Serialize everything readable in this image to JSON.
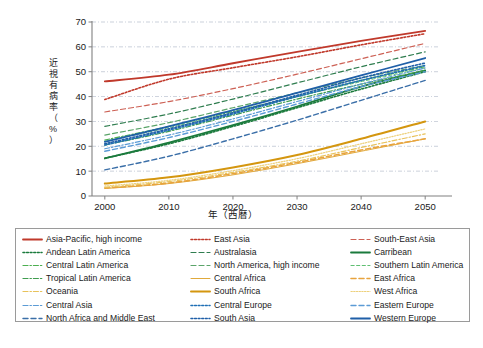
{
  "figure": {
    "background": "#ffffff",
    "axis_color": "#808080",
    "grid_color": "#9aa6bb",
    "text_color": "#1a1a1a"
  },
  "axes": {
    "y_title_chars": [
      "近",
      "視",
      "有",
      "病",
      "率",
      "（",
      "%",
      "）"
    ],
    "y_title": "近視有病率（%）",
    "x_title": "年（西暦）",
    "y_ticks": [
      "0",
      "10",
      "20",
      "30",
      "40",
      "50",
      "60",
      "70"
    ],
    "x_ticks": [
      "2000",
      "2010",
      "2020",
      "2030",
      "2040",
      "2050"
    ]
  },
  "legend": {
    "border_color": "#9a9a9a",
    "items": [
      {
        "label": "Asia-Pacific, high income",
        "color": "#c0392b",
        "style": "solid",
        "width": 1.8
      },
      {
        "label": "East Asia",
        "color": "#c0392b",
        "style": "dotted",
        "width": 1.6
      },
      {
        "label": "South-East Asia",
        "color": "#cd6155",
        "style": "dashed",
        "width": 1.2
      },
      {
        "label": "Andean Latin America",
        "color": "#1a7a3c",
        "style": "dotted",
        "width": 1.6
      },
      {
        "label": "Australasia",
        "color": "#2f7d4f",
        "style": "dashed",
        "width": 1.2
      },
      {
        "label": "Carribean",
        "color": "#1a7a3c",
        "style": "solid",
        "width": 1.8
      },
      {
        "label": "Central Latin America",
        "color": "#4caf50",
        "style": "dashdot",
        "width": 1.2
      },
      {
        "label": "North America, high income",
        "color": "#5aa469",
        "style": "dashed",
        "width": 1.2
      },
      {
        "label": "Southern Latin America",
        "color": "#5fbf72",
        "style": "dashed-fine",
        "width": 1.0
      },
      {
        "label": "Tropical Latin America",
        "color": "#3e9c4e",
        "style": "dashdot",
        "width": 1.2
      },
      {
        "label": "Central Africa",
        "color": "#e0a93b",
        "style": "solid",
        "width": 1.0
      },
      {
        "label": "East Africa",
        "color": "#e8a33d",
        "style": "dashed",
        "width": 1.6
      },
      {
        "label": "Oceania",
        "color": "#e8c25a",
        "style": "dashdot",
        "width": 1.2
      },
      {
        "label": "South Africa",
        "color": "#d4960f",
        "style": "solid",
        "width": 2.0
      },
      {
        "label": "West Africa",
        "color": "#edd07a",
        "style": "dotted",
        "width": 1.2
      },
      {
        "label": "Central Asia",
        "color": "#5b9bd5",
        "style": "dashdot",
        "width": 1.2
      },
      {
        "label": "Central Europe",
        "color": "#1f6fb5",
        "style": "dotted",
        "width": 1.6
      },
      {
        "label": "Eastern Europe",
        "color": "#5b9bd5",
        "style": "dashed",
        "width": 1.4
      },
      {
        "label": "North Africa and Middle East",
        "color": "#3b6fa8",
        "style": "dashed",
        "width": 1.4
      },
      {
        "label": "South Asia",
        "color": "#1f5fa8",
        "style": "dotted",
        "width": 1.6
      },
      {
        "label": "Western Europe",
        "color": "#1f5fa8",
        "style": "solid",
        "width": 1.8
      }
    ]
  },
  "chart_data": {
    "type": "line",
    "title": "",
    "xlabel": "年（西暦）",
    "ylabel": "近視有病率（%）",
    "xlim": [
      1998,
      2052
    ],
    "ylim": [
      0,
      70
    ],
    "grid": true,
    "legend_position": "below",
    "x": [
      2000,
      2010,
      2020,
      2030,
      2040,
      2050
    ],
    "series": [
      {
        "name": "Asia-Pacific, high income",
        "color": "#c0392b",
        "style": "solid",
        "values": [
          46.1,
          48.8,
          53.4,
          58.0,
          62.4,
          66.4
        ]
      },
      {
        "name": "East Asia",
        "color": "#c0392b",
        "style": "dotted",
        "values": [
          38.8,
          47.0,
          51.6,
          56.0,
          60.8,
          65.3
        ]
      },
      {
        "name": "South-East Asia",
        "color": "#cd6155",
        "style": "dashed",
        "values": [
          33.8,
          38.0,
          43.2,
          49.0,
          55.2,
          61.4
        ]
      },
      {
        "name": "Andean Latin America",
        "color": "#1a7a3c",
        "style": "dotted",
        "values": [
          15.2,
          21.0,
          28.0,
          35.5,
          43.0,
          50.0
        ]
      },
      {
        "name": "Australasia",
        "color": "#2f7d4f",
        "style": "dashed",
        "values": [
          28.0,
          33.0,
          39.0,
          45.5,
          52.0,
          58.0
        ]
      },
      {
        "name": "Carribean",
        "color": "#1a7a3c",
        "style": "solid",
        "values": [
          15.1,
          21.5,
          28.5,
          36.0,
          44.0,
          50.5
        ]
      },
      {
        "name": "Central Latin America",
        "color": "#4caf50",
        "style": "dashdot",
        "values": [
          22.5,
          28.0,
          34.0,
          40.0,
          46.5,
          52.0
        ]
      },
      {
        "name": "North America, high income",
        "color": "#5aa469",
        "style": "dashed",
        "values": [
          24.5,
          29.5,
          35.5,
          41.5,
          47.5,
          52.5
        ]
      },
      {
        "name": "Southern Latin America",
        "color": "#5fbf72",
        "style": "dashed-fine",
        "values": [
          22.0,
          27.5,
          33.5,
          40.0,
          46.0,
          51.5
        ]
      },
      {
        "name": "Tropical Latin America",
        "color": "#3e9c4e",
        "style": "dashdot",
        "values": [
          20.5,
          26.0,
          32.5,
          39.0,
          45.0,
          50.5
        ]
      },
      {
        "name": "Central Africa",
        "color": "#e0a93b",
        "style": "solid",
        "values": [
          3.0,
          5.0,
          8.5,
          13.0,
          18.0,
          23.0
        ]
      },
      {
        "name": "East Africa",
        "color": "#e8a33d",
        "style": "dashed",
        "values": [
          3.2,
          5.2,
          9.0,
          13.5,
          18.5,
          23.0
        ]
      },
      {
        "name": "Oceania",
        "color": "#e8c25a",
        "style": "dashdot",
        "values": [
          3.5,
          5.8,
          9.5,
          14.0,
          19.5,
          25.0
        ]
      },
      {
        "name": "South Africa",
        "color": "#d4960f",
        "style": "solid",
        "values": [
          5.0,
          7.5,
          11.5,
          16.5,
          23.0,
          30.0
        ]
      },
      {
        "name": "West Africa",
        "color": "#edd07a",
        "style": "dotted",
        "values": [
          4.0,
          6.3,
          10.2,
          15.0,
          21.0,
          27.0
        ]
      },
      {
        "name": "Central Asia",
        "color": "#5b9bd5",
        "style": "dashdot",
        "values": [
          19.0,
          24.5,
          31.0,
          38.0,
          45.0,
          51.5
        ]
      },
      {
        "name": "Central Europe",
        "color": "#1f6fb5",
        "style": "dotted",
        "values": [
          20.5,
          26.5,
          33.0,
          40.0,
          46.5,
          52.5
        ]
      },
      {
        "name": "Eastern Europe",
        "color": "#5b9bd5",
        "style": "dashed",
        "values": [
          18.0,
          23.5,
          30.0,
          37.0,
          44.0,
          50.0
        ]
      },
      {
        "name": "North Africa and Middle East",
        "color": "#3b6fa8",
        "style": "dashed",
        "values": [
          10.5,
          16.0,
          23.0,
          30.5,
          38.5,
          46.5
        ]
      },
      {
        "name": "South Asia",
        "color": "#1f5fa8",
        "style": "dotted",
        "values": [
          21.0,
          27.0,
          33.5,
          40.5,
          47.5,
          53.5
        ]
      },
      {
        "name": "Western Europe",
        "color": "#1f5fa8",
        "style": "solid",
        "values": [
          21.8,
          28.0,
          34.5,
          41.5,
          48.5,
          55.5
        ]
      }
    ]
  }
}
